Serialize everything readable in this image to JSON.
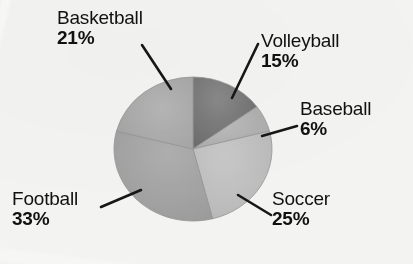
{
  "chart_data": {
    "type": "pie",
    "title": "",
    "subtitle": "",
    "xlabel": "",
    "ylabel": "",
    "legend_position": "none",
    "grid": false,
    "value_unit": "%",
    "categories": [
      "Volleyball",
      "Baseball",
      "Soccer",
      "Football",
      "Basketball"
    ],
    "values": [
      15,
      6,
      25,
      33,
      21
    ],
    "slices": [
      {
        "name": "volleyball",
        "label": "Volleyball",
        "percent_text": "15%",
        "value": 15,
        "color": "#787878",
        "start_angle_deg": 0,
        "end_angle_deg": 54
      },
      {
        "name": "baseball",
        "label": "Baseball",
        "percent_text": "6%",
        "value": 6,
        "color": "#b6b6b6",
        "start_angle_deg": 54,
        "end_angle_deg": 75.6
      },
      {
        "name": "soccer",
        "label": "Soccer",
        "percent_text": "25%",
        "value": 25,
        "color": "#c4c4c4",
        "start_angle_deg": 75.6,
        "end_angle_deg": 165.6
      },
      {
        "name": "football",
        "label": "Football",
        "percent_text": "33%",
        "value": 33,
        "color": "#a9a9a9",
        "start_angle_deg": 165.6,
        "end_angle_deg": 284.4
      },
      {
        "name": "basketball",
        "label": "Basketball",
        "percent_text": "21%",
        "value": 21,
        "color": "#b0b0b0",
        "start_angle_deg": 284.4,
        "end_angle_deg": 360
      }
    ]
  },
  "labels": {
    "basketball": {
      "name": "Basketball",
      "percent": "21%"
    },
    "volleyball": {
      "name": "Volleyball",
      "percent": "15%"
    },
    "baseball": {
      "name": "Baseball",
      "percent": "6%"
    },
    "soccer": {
      "name": "Soccer",
      "percent": "25%"
    },
    "football": {
      "name": "Football",
      "percent": "33%"
    }
  },
  "colors": {
    "background": "#fbfbfa",
    "text": "#111111",
    "leader_line": "#171717",
    "volleyball": "#787878",
    "baseball": "#b6b6b6",
    "soccer": "#c4c4c4",
    "football": "#a9a9a9",
    "basketball": "#b0b0b0"
  },
  "geometry": {
    "center_x": 193,
    "center_y": 149,
    "radius_x": 79,
    "radius_y": 72
  }
}
